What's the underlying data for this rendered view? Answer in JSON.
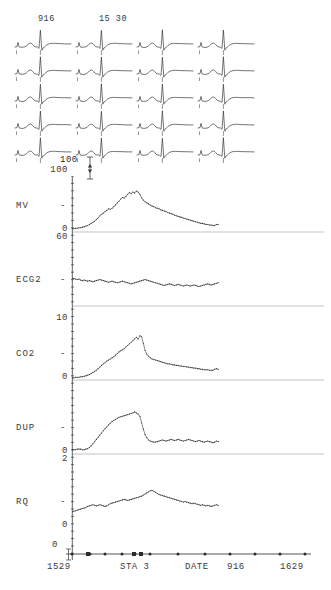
{
  "display": {
    "title": "Physiologic Trend Monitor",
    "trace_color": "#2b2b2b",
    "grid_color": "#9a9a9a",
    "axis_color": "#3a3a3a"
  },
  "ecg_matrix": {
    "columns": 4,
    "rows": 5,
    "column_labels": [
      "916",
      "15 30"
    ],
    "amplitude_scale_label": "100",
    "beat_label": "ecg-beat-waveform"
  },
  "chart_data": [
    {
      "type": "line",
      "name": "MV",
      "title": "MV",
      "ylabel": "MV",
      "ytick_high": "100",
      "ytick_low": "0",
      "baseline_label": "60",
      "ylim": [
        0,
        100
      ],
      "xlabel": "DATE",
      "grid": true,
      "values": [
        6,
        6,
        7,
        7,
        8,
        8,
        9,
        10,
        11,
        12,
        14,
        16,
        18,
        20,
        23,
        26,
        30,
        33,
        35,
        38,
        40,
        43,
        42,
        44,
        47,
        50,
        54,
        57,
        61,
        64,
        63,
        66,
        70,
        73,
        71,
        74,
        72,
        76,
        74,
        70,
        63,
        59,
        56,
        54,
        52,
        50,
        48,
        47,
        45,
        44,
        43,
        41,
        40,
        39,
        38,
        36,
        35,
        34,
        33,
        31,
        30,
        29,
        28,
        27,
        26,
        25,
        24,
        23,
        22,
        21,
        20,
        19,
        18,
        17,
        16,
        16,
        15,
        14,
        14,
        13,
        13,
        12,
        12,
        14,
        14
      ],
      "x_fraction_end": 0.58
    },
    {
      "type": "line",
      "name": "ECG2",
      "title": "ECG2",
      "ylabel": "ECG2",
      "ytick_high": "",
      "ytick_low": "",
      "ylim": [
        0,
        100
      ],
      "grid": true,
      "values": [
        52,
        51,
        50,
        49,
        50,
        48,
        47,
        48,
        47,
        46,
        47,
        46,
        45,
        46,
        47,
        48,
        49,
        48,
        47,
        46,
        45,
        44,
        45,
        46,
        45,
        44,
        43,
        44,
        45,
        46,
        45,
        44,
        43,
        42,
        41,
        42,
        43,
        44,
        45,
        46,
        47,
        48,
        49,
        48,
        47,
        46,
        45,
        44,
        43,
        42,
        41,
        40,
        39,
        38,
        39,
        40,
        41,
        40,
        39,
        38,
        39,
        40,
        39,
        38,
        37,
        38,
        39,
        38,
        37,
        38,
        39,
        38,
        37,
        36,
        37,
        38,
        39,
        40,
        41,
        40,
        39,
        40,
        41,
        42,
        43
      ],
      "x_fraction_end": 0.58
    },
    {
      "type": "line",
      "name": "CO2",
      "title": "CO2",
      "ylabel": "CO2",
      "ytick_high": "10",
      "ytick_low": "0",
      "ylim": [
        0,
        10
      ],
      "grid": true,
      "values": [
        4,
        4,
        5,
        5,
        5,
        6,
        6,
        7,
        8,
        9,
        10,
        12,
        14,
        16,
        18,
        21,
        24,
        27,
        30,
        32,
        35,
        37,
        39,
        41,
        43,
        46,
        49,
        52,
        54,
        56,
        58,
        61,
        64,
        67,
        70,
        73,
        76,
        79,
        76,
        82,
        80,
        68,
        55,
        48,
        44,
        41,
        39,
        38,
        37,
        36,
        35,
        34,
        33,
        32,
        31,
        30,
        30,
        29,
        28,
        28,
        27,
        27,
        26,
        26,
        25,
        25,
        24,
        24,
        23,
        23,
        22,
        22,
        21,
        21,
        20,
        20,
        19,
        19,
        19,
        18,
        18,
        18,
        20,
        21,
        20
      ],
      "x_fraction_end": 0.58
    },
    {
      "type": "line",
      "name": "DUP",
      "title": "DUP",
      "ylabel": "DUP",
      "ytick_high": "",
      "ytick_low": "0",
      "baseline_label": "2",
      "ylim": [
        0,
        10
      ],
      "grid": true,
      "values": [
        8,
        8,
        8,
        9,
        9,
        9,
        8,
        8,
        9,
        10,
        12,
        15,
        19,
        23,
        27,
        31,
        35,
        39,
        43,
        47,
        50,
        54,
        57,
        60,
        62,
        64,
        66,
        68,
        69,
        70,
        71,
        72,
        73,
        74,
        75,
        76,
        78,
        76,
        74,
        70,
        58,
        46,
        36,
        30,
        26,
        24,
        23,
        22,
        22,
        23,
        24,
        25,
        26,
        25,
        24,
        25,
        26,
        27,
        26,
        25,
        26,
        27,
        26,
        25,
        24,
        25,
        26,
        27,
        26,
        25,
        24,
        23,
        24,
        25,
        24,
        23,
        22,
        23,
        24,
        23,
        22,
        21,
        22,
        24,
        23
      ],
      "x_fraction_end": 0.58
    },
    {
      "type": "line",
      "name": "RQ",
      "title": "RQ",
      "ylabel": "RQ",
      "ytick_high": "",
      "ytick_low": "0",
      "ylim": [
        0,
        10
      ],
      "grid": false,
      "values": [
        30,
        31,
        32,
        33,
        34,
        35,
        36,
        37,
        38,
        40,
        41,
        42,
        43,
        42,
        41,
        42,
        43,
        42,
        41,
        40,
        41,
        43,
        45,
        46,
        47,
        48,
        49,
        50,
        51,
        52,
        53,
        52,
        51,
        52,
        53,
        54,
        55,
        56,
        57,
        58,
        59,
        61,
        63,
        65,
        67,
        69,
        70,
        68,
        66,
        64,
        62,
        61,
        60,
        59,
        58,
        57,
        56,
        55,
        54,
        53,
        52,
        51,
        50,
        49,
        48,
        49,
        48,
        47,
        46,
        45,
        46,
        45,
        44,
        43,
        42,
        43,
        42,
        41,
        42,
        41,
        40,
        41,
        42,
        43,
        42
      ],
      "x_fraction_end": 0.58
    }
  ],
  "time_axis": {
    "zero_label": "0",
    "labels": [
      {
        "text": "1529",
        "x": 47
      },
      {
        "text": "STA 3",
        "x": 120
      },
      {
        "text": "DATE",
        "x": 185
      },
      {
        "text": "916",
        "x": 227
      },
      {
        "text": "1629",
        "x": 280
      }
    ],
    "tick_positions": [
      72,
      90,
      105,
      122,
      135,
      150,
      178,
      205,
      230,
      255,
      280,
      305
    ],
    "marker_positions": [
      88,
      134,
      141
    ]
  }
}
